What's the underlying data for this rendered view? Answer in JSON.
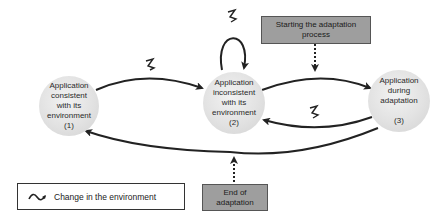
{
  "diagram": {
    "states": [
      {
        "id": "s1",
        "label": "Application\nconsistent\nwith its\nenvironment\n(1)"
      },
      {
        "id": "s2",
        "label": "Application\ninconsistent\nwith its\nenvironment\n(2)"
      },
      {
        "id": "s3",
        "label": "Application\nduring\nadaptation\n\n(3)"
      }
    ],
    "notes": {
      "start": "Starting the adaptation\nprocess",
      "end": "End of\nadaptation"
    },
    "legend": {
      "icon": "squiggle-icon",
      "label": "Change in the environment"
    },
    "colors": {
      "node_fill": "#e0e0e0",
      "note_fill": "#9e9e9e",
      "edge": "#222222"
    }
  }
}
